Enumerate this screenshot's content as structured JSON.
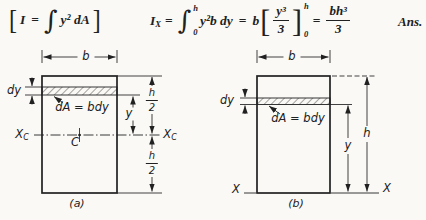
{
  "colors": {
    "paper": "#faf9f6",
    "ink": "#212121"
  },
  "equation": {
    "definition": {
      "open_bracket": "[",
      "lhs": "I",
      "equals": "=",
      "integral": "∫",
      "integrand": "y² dA",
      "close_bracket": "]"
    },
    "main": {
      "lhs_base": "I",
      "lhs_sub": "X",
      "equals_1": "=",
      "integral": "∫",
      "upper_limit": "h",
      "lower_limit": "0",
      "integrand": "y²b dy",
      "equals_2": "=",
      "coefficient": "b",
      "open_bracket": "[",
      "frac_num": "y³",
      "frac_den": "3",
      "close_bracket": "]",
      "eval_upper": "h",
      "eval_lower": "0",
      "equals_3": "=",
      "result_num": "bh³",
      "result_den": "3"
    },
    "answer_label": "Ans."
  },
  "figure_a": {
    "caption": "(a)",
    "width_label": "b",
    "thickness_label": "dy",
    "strip_label": "dA = bdy",
    "y_label": "y",
    "upper_half": {
      "num": "h",
      "den": "2"
    },
    "lower_half": {
      "num": "h",
      "den": "2"
    },
    "axis_label_base": "X",
    "axis_label_sub": "C",
    "centroid_label": "C"
  },
  "figure_b": {
    "caption": "(b)",
    "width_label": "b",
    "thickness_label": "dy",
    "strip_label": "dA = bdy",
    "y_label": "y",
    "height_label": "h",
    "axis_label": "X"
  }
}
